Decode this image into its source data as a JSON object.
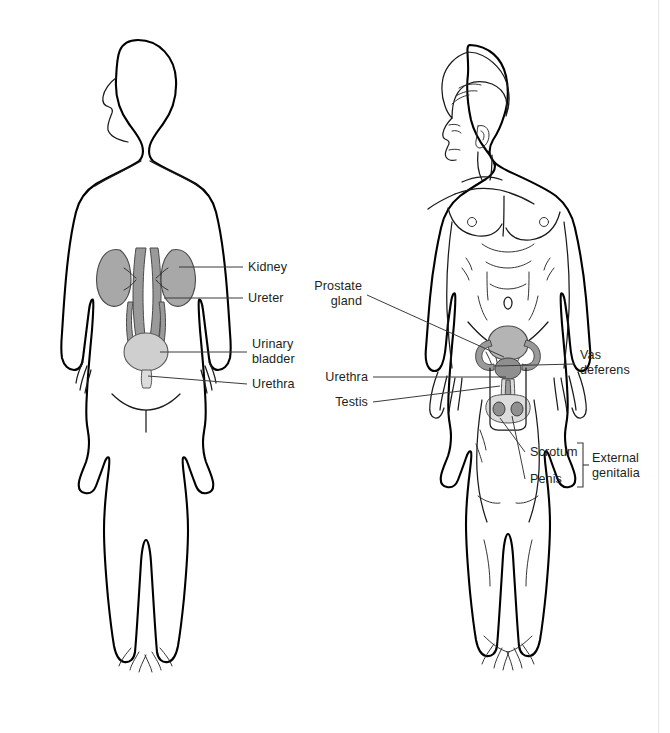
{
  "figure": {
    "background_color": "#ffffff",
    "ink_color": "#000000",
    "text_color": "#231f20",
    "leader_color": "#3b3b3b"
  },
  "left_figure": {
    "name": "urinary-system-figure",
    "description": "Outline silhouette of a male body, front view, showing the urinary tract",
    "style": "plain outline, no facial or muscular detail",
    "organ_colors": {
      "kidney": "#a8a8a8",
      "ureter": "#9a9a9a",
      "bladder": "#cfcfcf"
    },
    "labels": [
      {
        "id": "kidney",
        "text": "Kidney",
        "lines": [
          "Kidney"
        ],
        "align": "left",
        "x": 248,
        "y": 271
      },
      {
        "id": "ureter",
        "text": "Ureter",
        "lines": [
          "Ureter"
        ],
        "align": "left",
        "x": 248,
        "y": 302
      },
      {
        "id": "urinary-bladder",
        "text": "Urinary bladder",
        "lines": [
          "Urinary",
          "bladder"
        ],
        "align": "left",
        "x": 252,
        "y": 343
      },
      {
        "id": "urethra",
        "text": "Urethra",
        "lines": [
          "Urethra"
        ],
        "align": "left",
        "x": 252,
        "y": 382
      }
    ]
  },
  "right_figure": {
    "name": "reproductive-system-figure",
    "description": "Anatomically rendered male body, front view, showing the reproductive organs",
    "style": "detailed line art with hair, face in profile, pectorals, navel and musculature",
    "organ_colors": {
      "bladder": "#b4b4b4",
      "prostate": "#8f8f8f",
      "scrotum": "#dcdcdc"
    },
    "labels": [
      {
        "id": "prostate-gland",
        "text": "Prostate gland",
        "lines": [
          "Prostate",
          "gland"
        ],
        "align": "right",
        "x": 362,
        "y": 290
      },
      {
        "id": "urethra-2",
        "text": "Urethra",
        "lines": [
          "Urethra"
        ],
        "align": "right",
        "x": 368,
        "y": 381
      },
      {
        "id": "testis",
        "text": "Testis",
        "lines": [
          "Testis"
        ],
        "align": "right",
        "x": 368,
        "y": 406
      },
      {
        "id": "vas-deferens",
        "text": "Vas deferens",
        "lines": [
          "Vas",
          "deferens"
        ],
        "align": "left",
        "x": 580,
        "y": 359
      },
      {
        "id": "scrotum",
        "text": "Scrotum",
        "lines": [
          "Scrotum"
        ],
        "align": "left",
        "x": 530,
        "y": 456
      },
      {
        "id": "penis",
        "text": "Penis",
        "lines": [
          "Penis"
        ],
        "align": "left",
        "x": 530,
        "y": 483
      },
      {
        "id": "external-genitalia",
        "text": "External genitalia",
        "lines": [
          "External",
          "genitalia"
        ],
        "align": "left",
        "x": 592,
        "y": 462
      }
    ],
    "bracket": {
      "id": "external-genitalia-bracket",
      "groups": [
        "Scrotum",
        "Penis"
      ],
      "label": "External genitalia"
    }
  }
}
